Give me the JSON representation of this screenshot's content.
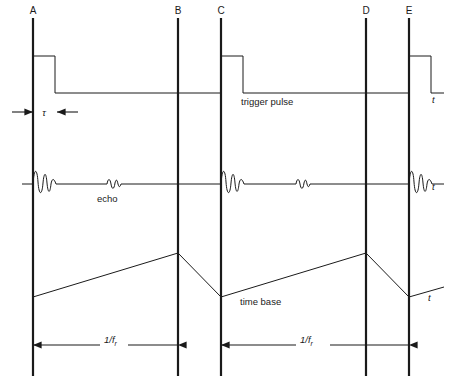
{
  "figure": {
    "background_color": "#ffffff",
    "ink_color": "#1a1a1a",
    "width": 452,
    "height": 392
  },
  "markers": [
    {
      "label": "A",
      "x": 33
    },
    {
      "label": "B",
      "x": 178
    },
    {
      "label": "C",
      "x": 221
    },
    {
      "label": "D",
      "x": 366
    },
    {
      "label": "E",
      "x": 409
    }
  ],
  "traces": [
    {
      "name": "trigger-pulse",
      "label": "trigger pulse",
      "axis_label": "t",
      "baseline_y": 93,
      "pulse_top_y": 56,
      "pulse_starts": [
        33,
        221,
        409
      ],
      "pulse_width": 22
    },
    {
      "name": "echo-trace",
      "label": "echo",
      "axis_label": "t",
      "baseline_y": 184,
      "transmit_bursts": [
        33,
        221,
        409
      ],
      "echo_bursts": [
        113,
        302
      ],
      "transmit_amplitude": 17,
      "echo_amplitude": 6
    },
    {
      "name": "time-base",
      "label": "time base",
      "axis_label": "t",
      "low_y": 297,
      "peak_y": 253,
      "ramp_starts": [
        33,
        221,
        409
      ],
      "ramp_peaks": [
        178,
        366
      ]
    }
  ],
  "dimensions": [
    {
      "name": "pulse-width-tau",
      "label": "τ",
      "y": 112,
      "from_x": 12,
      "to_x": 78,
      "marker_x": 33
    },
    {
      "name": "prf-period-1",
      "label_numerator": "1/f",
      "label_subscript": "r",
      "y": 345,
      "from_x": 33,
      "to_x": 178
    },
    {
      "name": "prf-period-2",
      "label_numerator": "1/f",
      "label_subscript": "r",
      "y": 345,
      "from_x": 221,
      "to_x": 409
    }
  ],
  "vertical_lines": {
    "top_y": 18,
    "bottom_y": 376
  },
  "text_labels": {
    "trigger_pulse": "trigger pulse",
    "echo": "echo",
    "time_base": "time base",
    "t_axis": "t",
    "tau": "τ",
    "prf": "1/f",
    "prf_subscript": "r"
  }
}
